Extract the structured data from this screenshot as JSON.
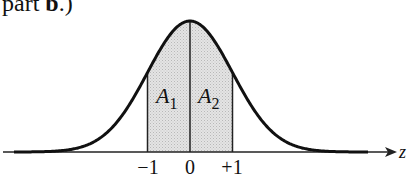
{
  "caption": {
    "prefix": "part ",
    "bold": "b",
    "suffix": ".)"
  },
  "diagram": {
    "type": "standard-normal-curve",
    "axis_label": "z",
    "ticks": [
      {
        "value": -1,
        "label": "−1"
      },
      {
        "value": 0,
        "label": "0"
      },
      {
        "value": 1,
        "label": "+1"
      }
    ],
    "regions": [
      {
        "name": "A",
        "sub": "1",
        "from": -1,
        "to": 0
      },
      {
        "name": "A",
        "sub": "2",
        "from": 0,
        "to": 1
      }
    ],
    "colors": {
      "curve": "#111111",
      "shade": "#d9d9d9",
      "axis": "#222222"
    }
  }
}
